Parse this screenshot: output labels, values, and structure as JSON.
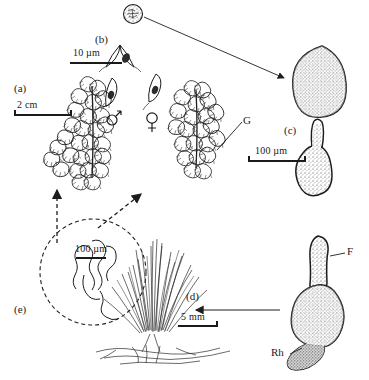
{
  "figure": {
    "background_color": "#ffffff",
    "ink_color": "#1d1d1d",
    "width": 369,
    "height": 380
  },
  "panels": [
    {
      "id": "a",
      "label": "(a)",
      "caption": "Gametophyte shoot with leaves",
      "scale_bar": {
        "label": "2 cm",
        "length_px": 58
      }
    },
    {
      "id": "b",
      "label": "(b)",
      "caption": "Gametangia: antheridium and archegonium",
      "scale_bar": {
        "label": "10 µm",
        "length_px": 52
      }
    },
    {
      "id": "c",
      "label": "(c)",
      "caption": "Spore and germinating spore",
      "scale_bar": {
        "label": "100 µm",
        "length_px": 58
      }
    },
    {
      "id": "d",
      "label": "(d)",
      "caption": "Whole plant tuft with rhizoids",
      "scale_bar": {
        "label": "5 mm",
        "length_px": 40
      }
    },
    {
      "id": "e",
      "label": "(e)",
      "caption": "Protonema detail (dashed circle inset)",
      "scale_bar": {
        "label": "100 µm",
        "length_px": 30
      }
    }
  ],
  "annotations": [
    {
      "name": "gemma",
      "text": "G"
    },
    {
      "name": "filament",
      "text": "F"
    },
    {
      "name": "rhizoid",
      "text": "Rh"
    }
  ],
  "symbols": [
    {
      "name": "male",
      "glyph": "♂"
    },
    {
      "name": "female",
      "glyph": "♀"
    }
  ],
  "scale_bars": {
    "a": "2 cm",
    "b": "10 µm",
    "c": "100 µm",
    "d": "5 mm",
    "e": "100 µm"
  }
}
